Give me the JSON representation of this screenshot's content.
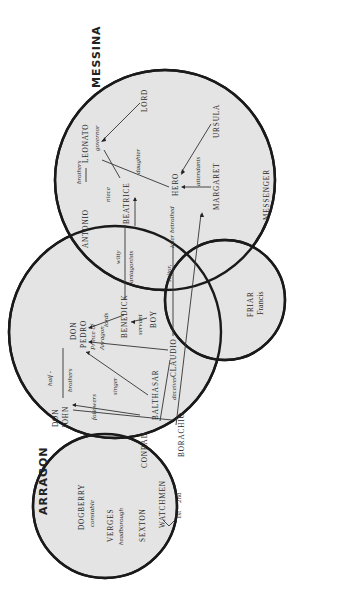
{
  "regions": {
    "messina": "MESSINA",
    "arragon": "ARRAGON"
  },
  "characters": {
    "leonato": "LEONATO",
    "antonio": "ANTONIO",
    "lord": "LORD",
    "beatrice": "BEATRICE",
    "hero": "HERO",
    "ursula": "URSULA",
    "margaret": "MARGARET",
    "messenger": "MESSENGER",
    "benedick": "BENEDICK",
    "boy": "BOY",
    "claudio": "CLAUDIO",
    "don_pedro_1": "DON",
    "don_pedro_2": "PEDRO",
    "don_pedro_title_1": "Prince of",
    "don_pedro_title_2": "Arragon",
    "don_john_1": "DON",
    "don_john_2": "JOHN",
    "balthasar": "BALTHASAR",
    "conrad": "CONRAD",
    "borachio": "BORACHIO",
    "friar": "FRIAR",
    "friar_name": "Francis",
    "dogberry": "DOGBERRY",
    "dogberry_role": "constable",
    "verges": "VERGES",
    "verges_role": "headborough",
    "sexton": "SEXTON",
    "watchmen": "WATCHMEN",
    "watch_1st": "1st",
    "watch_2nd": "2nd"
  },
  "relations": {
    "brothers_leonato": "brothers",
    "governor": "governor",
    "niece": "niece",
    "daughter": "daughter",
    "attendants": "attendants",
    "witty": "witty",
    "antagonists": "antagonists",
    "suitor": "suitor,",
    "later_betrothed": "later betrothed",
    "lords": "lords",
    "servant": "servant",
    "singer": "singer",
    "half": "half -",
    "brothers_pedro": "brothers",
    "followers": "followers",
    "deceiver": "deceiver"
  },
  "colors": {
    "circle_fill": "#e4e4e4",
    "stroke": "#1a1a1a",
    "background": "#ffffff"
  }
}
